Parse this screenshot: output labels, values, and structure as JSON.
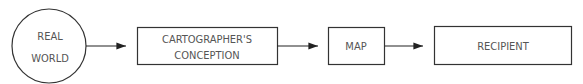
{
  "diagram": {
    "nodes": [
      {
        "id": "real-world",
        "shape": "circle",
        "lines": [
          "REAL",
          "WORLD"
        ]
      },
      {
        "id": "cartographers-conception",
        "shape": "rect",
        "lines": [
          "CARTOGRAPHER'S",
          "CONCEPTION"
        ]
      },
      {
        "id": "map",
        "shape": "rect",
        "lines": [
          "MAP"
        ]
      },
      {
        "id": "recipient",
        "shape": "rect",
        "lines": [
          "RECIPIENT"
        ]
      }
    ],
    "edges": [
      {
        "from": "real-world",
        "to": "cartographers-conception"
      },
      {
        "from": "cartographers-conception",
        "to": "map"
      },
      {
        "from": "map",
        "to": "recipient"
      }
    ],
    "colors": {
      "stroke": "#333333",
      "text": "#555555",
      "background": "#ffffff"
    }
  }
}
